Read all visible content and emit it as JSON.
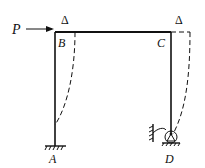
{
  "diagram": {
    "type": "portal-frame",
    "labels": {
      "load": "P",
      "node_b": "B",
      "node_c": "C",
      "node_a": "A",
      "node_d": "D",
      "delta_left": "Δ",
      "delta_right": "Δ"
    },
    "supports": {
      "A": "fixed",
      "D": "roller with rotational spring"
    },
    "deflected_shape": "dashed"
  }
}
